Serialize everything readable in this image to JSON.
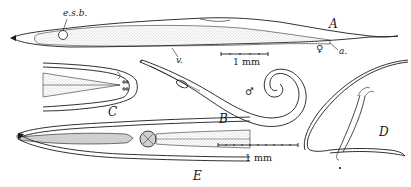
{
  "figure": {
    "panels": [
      {
        "id": "A",
        "label": "A",
        "description": "whole female nematode, lateral view"
      },
      {
        "id": "B",
        "label": "B",
        "description": "whole male nematode with coiled tail"
      },
      {
        "id": "C",
        "label": "C",
        "description": "head end, enlarged"
      },
      {
        "id": "D",
        "label": "D",
        "description": "male tail with spicule"
      },
      {
        "id": "E",
        "label": "E",
        "description": "anterior end showing oesophagus and bulb"
      }
    ],
    "annotations": {
      "esb": "e.s.b.",
      "v": "v.",
      "a": "a.",
      "female_symbol": "♀",
      "male_symbol": "♂"
    },
    "scale_bars": [
      {
        "id": "scale-top",
        "label": "1 mm"
      },
      {
        "id": "scale-bottom",
        "label": "1 mm"
      }
    ],
    "colors": {
      "ink": "#1a1a1a",
      "stipple": "#7a7a7a",
      "background": "#ffffff"
    }
  }
}
